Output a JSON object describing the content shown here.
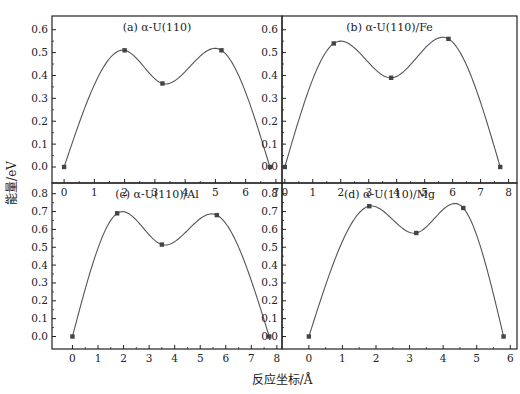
{
  "figure": {
    "ylabel": "能量/eV",
    "xlabel": "反应坐标/Å"
  },
  "chart_data": [
    {
      "type": "line",
      "panel": "a",
      "title": "(a) α-U(110)",
      "xlabel": "反应坐标/Å",
      "ylabel": "能量/eV",
      "x_ticks": [
        0,
        1,
        2,
        3,
        4,
        5,
        6,
        7
      ],
      "y_ticks": [
        0.0,
        0.1,
        0.2,
        0.3,
        0.4,
        0.5,
        0.6
      ],
      "xlim": [
        -0.4,
        7.2
      ],
      "ylim": [
        -0.07,
        0.66
      ],
      "points": {
        "x": [
          0,
          2.0,
          3.25,
          5.2,
          6.8
        ],
        "y": [
          0.0,
          0.51,
          0.365,
          0.51,
          0.0
        ]
      }
    },
    {
      "type": "line",
      "panel": "b",
      "title": "(b) α-U(110)/Fe",
      "xlabel": "反应坐标/Å",
      "ylabel": "能量/eV",
      "x_ticks": [
        0,
        1,
        2,
        3,
        4,
        5,
        6,
        7,
        8
      ],
      "y_ticks": [
        0.0,
        0.1,
        0.2,
        0.3,
        0.4,
        0.5,
        0.6
      ],
      "xlim": [
        -0.1,
        8.3
      ],
      "ylim": [
        -0.07,
        0.66
      ],
      "points": {
        "x": [
          0,
          1.75,
          3.8,
          5.85,
          7.7
        ],
        "y": [
          0.0,
          0.54,
          0.39,
          0.56,
          0.0
        ]
      }
    },
    {
      "type": "line",
      "panel": "c",
      "title": "(c) α-U(110)/Al",
      "xlabel": "反应坐标/Å",
      "ylabel": "能量/eV",
      "x_ticks": [
        0,
        1,
        2,
        3,
        4,
        5,
        6,
        7,
        8
      ],
      "y_ticks": [
        0.0,
        0.1,
        0.2,
        0.3,
        0.4,
        0.5,
        0.6,
        0.7,
        0.8
      ],
      "xlim": [
        -0.8,
        8.2
      ],
      "ylim": [
        -0.07,
        0.86
      ],
      "points": {
        "x": [
          0,
          1.75,
          3.5,
          5.65,
          7.7
        ],
        "y": [
          0.0,
          0.69,
          0.515,
          0.68,
          0.0
        ]
      }
    },
    {
      "type": "line",
      "panel": "d",
      "title": "(d) α-U(110)/Mg",
      "xlabel": "反应坐标/Å",
      "ylabel": "能量/eV",
      "x_ticks": [
        0,
        1,
        2,
        3,
        4,
        5,
        6
      ],
      "y_ticks": [
        0.0,
        0.1,
        0.2,
        0.3,
        0.4,
        0.5,
        0.6,
        0.7,
        0.8
      ],
      "xlim": [
        -0.8,
        6.2
      ],
      "ylim": [
        -0.07,
        0.86
      ],
      "points": {
        "x": [
          0,
          1.8,
          3.2,
          4.6,
          5.8
        ],
        "y": [
          0.0,
          0.73,
          0.58,
          0.72,
          0.0
        ]
      }
    }
  ],
  "style": {
    "line_color": "#555555",
    "marker_color": "#444444",
    "axis_color": "#222222"
  }
}
